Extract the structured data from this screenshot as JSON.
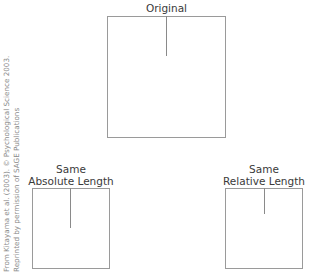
{
  "figure": {
    "original": {
      "label": "Original",
      "box": {
        "x": 107,
        "y": 16,
        "w": 119,
        "h": 122
      },
      "line_length": 40
    },
    "absolute": {
      "label_line1": "Same",
      "label_line2": "Absolute Length",
      "box": {
        "x": 32,
        "y": 188,
        "w": 78,
        "h": 81
      },
      "line_length": 40
    },
    "relative": {
      "label_line1": "Same",
      "label_line2": "Relative Length",
      "box": {
        "x": 225,
        "y": 188,
        "w": 78,
        "h": 81
      },
      "line_length": 26
    }
  },
  "credit": {
    "line1": "From Kitayama et al. (2003). © Psychological Science 2003.",
    "line2": "Reprinted by permission of SAGE Publications"
  },
  "colors": {
    "box_border": "#9a9a9a",
    "line": "#8a8a8a",
    "text": "#3a3a3a",
    "credit": "#8a8a8a"
  }
}
